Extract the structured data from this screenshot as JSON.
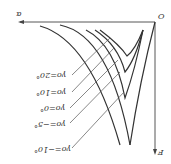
{
  "diagram": {
    "orientation": "rotated-180",
    "origin_label": "O",
    "x_axis_label": "α",
    "y_axis_label": "F",
    "curves": [
      {
        "label": "γo=20°"
      },
      {
        "label": "γo=10°"
      },
      {
        "label": "γo=0°"
      },
      {
        "label": "γo=−5°"
      },
      {
        "label": "γo=−10°"
      }
    ]
  }
}
